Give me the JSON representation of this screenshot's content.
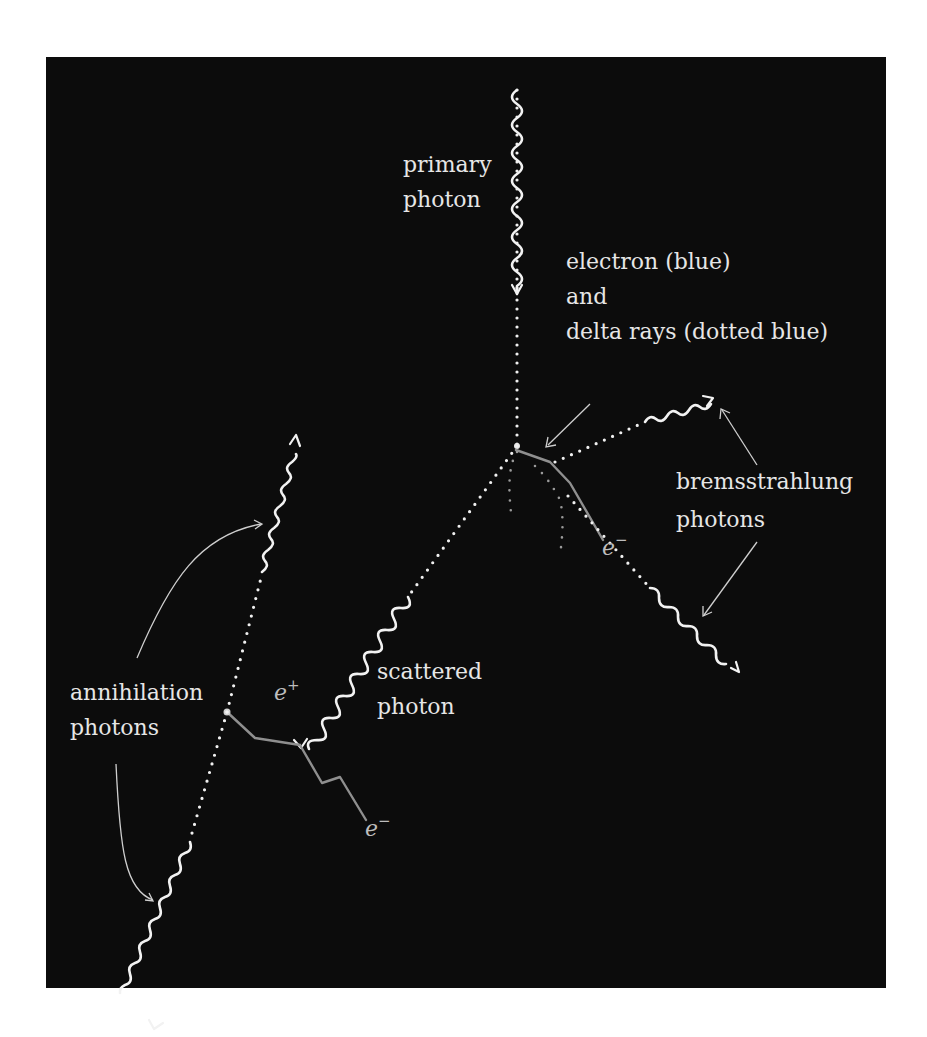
{
  "figure": {
    "background_color": "#0c0c0c",
    "page_color": "#ffffff"
  },
  "labels": {
    "primary_photon": [
      "primary",
      "photon"
    ],
    "electron_delta": [
      "electron (blue)",
      "and",
      "delta rays (dotted blue)"
    ],
    "bremsstrahlung": [
      "bremsstrahlung",
      "photons"
    ],
    "scattered_photon": [
      "scattered",
      "photon"
    ],
    "annihilation": [
      "annihilation",
      "photons"
    ],
    "electron_symbol": "e",
    "electron_sup": "−",
    "positron_symbol": "e",
    "positron_sup": "+"
  },
  "elements": {
    "primary_photon": {
      "from": [
        517,
        57
      ],
      "to": [
        517,
        290
      ],
      "style": "wavy+arrow"
    },
    "primary_photon_path": {
      "from": [
        517,
        290
      ],
      "to": [
        517,
        445
      ],
      "style": "dotted"
    },
    "compton_vertex": [
      517,
      445
    ],
    "recoil_electron_1": {
      "points": [
        [
          517,
          445
        ],
        [
          550,
          462
        ],
        [
          575,
          490
        ],
        [
          603,
          540
        ]
      ],
      "label": "e−"
    },
    "brems_photon_upper": {
      "from": [
        555,
        462
      ],
      "to": [
        713,
        397
      ]
    },
    "brems_photon_lower": {
      "from": [
        565,
        495
      ],
      "to": [
        738,
        670
      ]
    },
    "scattered_photon": {
      "from": [
        517,
        445
      ],
      "to": [
        300,
        745
      ]
    },
    "pair_vertex": [
      300,
      745
    ],
    "positron_track": {
      "points": [
        [
          300,
          745
        ],
        [
          255,
          737
        ],
        [
          227,
          712
        ]
      ],
      "label": "e+"
    },
    "electron_track_2": {
      "points": [
        [
          300,
          745
        ],
        [
          322,
          783
        ],
        [
          340,
          777
        ],
        [
          366,
          820
        ]
      ],
      "label": "e−"
    },
    "annihilation_point": [
      227,
      712
    ],
    "annihilation_photon_upper": {
      "to": [
        296,
        435
      ]
    },
    "annihilation_photon_lower": {
      "to": [
        153,
        1028
      ]
    }
  },
  "legend": {
    "photon": "wavy line with arrow",
    "electron": "solid line",
    "delta_ray": "dotted line"
  }
}
